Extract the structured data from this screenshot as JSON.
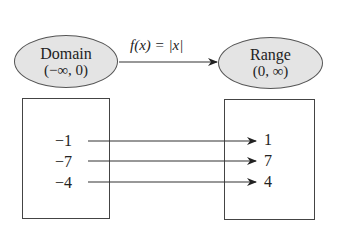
{
  "domain_node": {
    "title": "Domain",
    "interval": "(−∞, 0)"
  },
  "range_node": {
    "title": "Range",
    "interval": "(0, ∞)"
  },
  "function": {
    "label": "f(x) = |x|"
  },
  "mappings": [
    {
      "input": "−1",
      "output": "1"
    },
    {
      "input": "−7",
      "output": "7"
    },
    {
      "input": "−4",
      "output": "4"
    }
  ],
  "colors": {
    "ellipse_fill": "#e4e4e4",
    "stroke": "#444444",
    "text": "#222222"
  }
}
